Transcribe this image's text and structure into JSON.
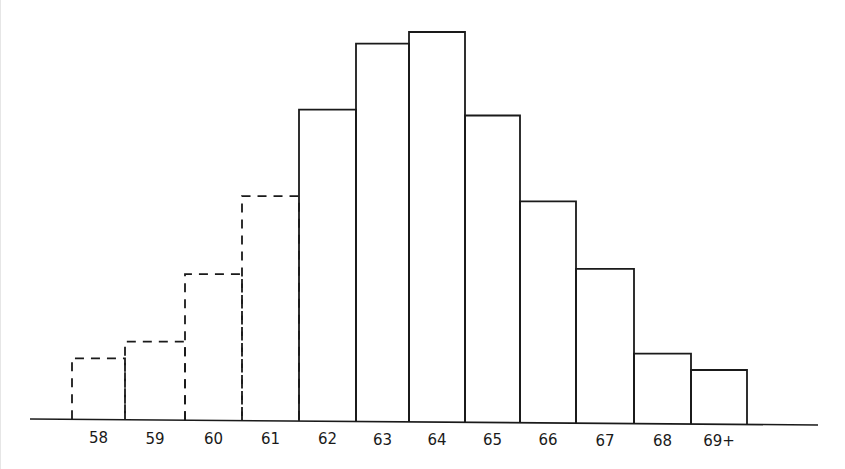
{
  "chart_data": {
    "type": "bar",
    "subtype": "histogram",
    "title": "",
    "xlabel": "",
    "ylabel": "",
    "categories": [
      "58",
      "59",
      "60",
      "61",
      "62",
      "63",
      "64",
      "65",
      "66",
      "67",
      "68",
      "69+"
    ],
    "values": [
      15.7,
      20.1,
      37.5,
      57.6,
      79.9,
      96.9,
      100,
      78.7,
      56.8,
      39.6,
      18.0,
      13.9
    ],
    "value_units": "relative height (tallest bar = 100); no y-axis scale shown",
    "line_styles": [
      "dashed",
      "dashed",
      "dashed",
      "dashed",
      "solid",
      "solid",
      "solid",
      "solid",
      "solid",
      "solid",
      "solid",
      "solid"
    ],
    "annotations": [],
    "legend": null,
    "grid": false,
    "y_axis_visible": false,
    "ylim": [
      0,
      100
    ]
  },
  "colors": {
    "line": "#1a1a1a",
    "background": "#ffffff"
  },
  "layout": {
    "baseline_left": [
      30,
      419
    ],
    "baseline_right": [
      818,
      425
    ],
    "bin_edges_px": [
      72,
      125,
      185,
      242,
      299,
      356,
      409,
      465,
      520,
      576,
      634,
      691,
      747
    ],
    "bar_tops_px": [
      360,
      343,
      275,
      197,
      110,
      44,
      32,
      115,
      200,
      267,
      351,
      367
    ],
    "label_y_px": 443
  }
}
